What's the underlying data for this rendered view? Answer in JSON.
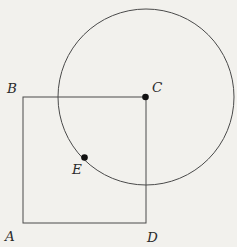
{
  "figure": {
    "background_color": "#f2f1ed",
    "line_color": "#4a4a4a",
    "label_color": "#2b2b2b",
    "labels": {
      "A": "A",
      "B": "B",
      "C": "C",
      "D": "D",
      "E": "E"
    },
    "geometry": {
      "square": {
        "left": 23,
        "top": 97,
        "width": 123,
        "height": 126,
        "corners": [
          "B top-left",
          "C top-right",
          "D bottom-right",
          "A bottom-left"
        ]
      },
      "circle": {
        "cx": 146,
        "cy": 97,
        "r": 88,
        "center": "C"
      },
      "marked_points": [
        {
          "label": "C",
          "x": 146,
          "y": 97,
          "has_dot": true
        },
        {
          "label": "E",
          "x": 84,
          "y": 158,
          "has_dot": true,
          "note": "on circle, inside square"
        }
      ]
    }
  }
}
